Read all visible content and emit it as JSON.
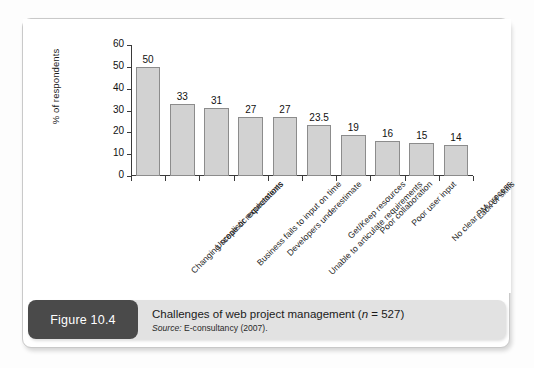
{
  "figure": {
    "badge_label": "Figure 10.4",
    "caption_title_pre": "Challenges of web project management (",
    "caption_title_italic": "n",
    "caption_title_post": " = 527)",
    "source_label": "Source:",
    "source_text": " E-consultancy (2007)."
  },
  "colors": {
    "bar_fill": "#d2d2d2",
    "bar_stroke": "#8c8c8c",
    "axis": "#3a3a3a",
    "badge_bg": "#4a4a4a",
    "caption_bg": "#e2e2e2",
    "panel_bg": "#ffffff"
  },
  "chart_data": {
    "type": "bar",
    "title": "Challenges of web project management (n = 527)",
    "subtitle": "Source: E-consultancy (2007).",
    "xlabel": "",
    "ylabel": "% of respondents",
    "ylim": [
      0,
      60
    ],
    "yticks": [
      0,
      10,
      20,
      30,
      40,
      50,
      60
    ],
    "ytick_labels": [
      "0",
      "10",
      "20",
      "30",
      "40",
      "50",
      "60"
    ],
    "grid": false,
    "legend": false,
    "data_labels": true,
    "orientation": "vertical",
    "categories": [
      "Changing scope or requirements",
      "Unrealistic expectations",
      "Business fails to input on time",
      "Developers underestimate",
      "Unable to articulate requirements",
      "Get/Keep resources",
      "Poor collaboration",
      "Poor user input",
      "No clear PM process",
      "Lack of skills"
    ],
    "values": [
      50,
      33,
      31,
      27,
      27,
      23.5,
      19,
      16,
      15,
      14
    ],
    "value_labels": [
      "50",
      "33",
      "31",
      "27",
      "27",
      "23.5",
      "19",
      "16",
      "15",
      "14"
    ]
  }
}
